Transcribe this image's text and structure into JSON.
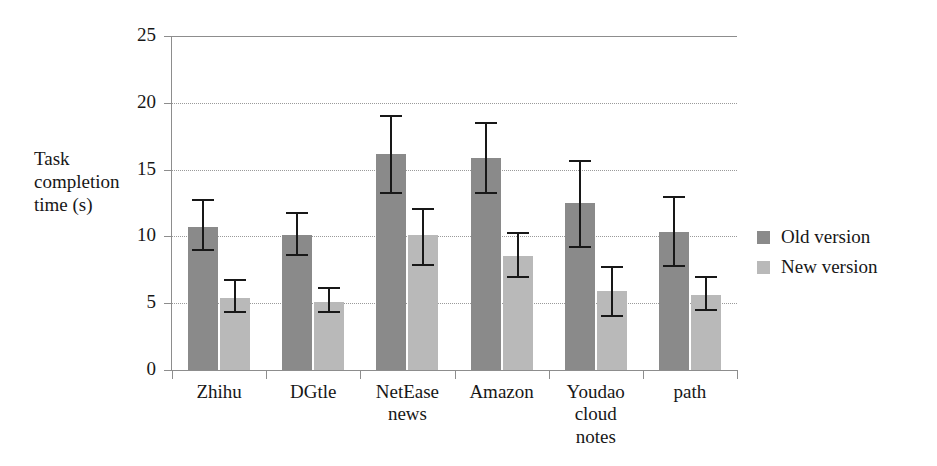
{
  "chart_data": {
    "type": "bar",
    "title": "",
    "xlabel": "",
    "ylabel": "Task completion time (s)",
    "ylim": [
      0,
      25
    ],
    "yticks": [
      0,
      5,
      10,
      15,
      20,
      25
    ],
    "grid": true,
    "legend_position": "right",
    "categories": [
      "Zhihu",
      "DGtle",
      "NetEase news",
      "Amazon",
      "Youdao cloud notes",
      "path"
    ],
    "series": [
      {
        "name": "Old version",
        "color": "#8a8a8a",
        "values": [
          10.7,
          10.1,
          16.2,
          15.9,
          12.5,
          10.3
        ],
        "error_low": [
          8.9,
          8.5,
          13.2,
          13.2,
          9.1,
          7.7
        ],
        "error_high": [
          12.8,
          11.8,
          19.1,
          18.6,
          15.7,
          13.0
        ]
      },
      {
        "name": "New version",
        "color": "#b9b9b9",
        "values": [
          5.4,
          5.1,
          10.1,
          8.5,
          5.9,
          5.6
        ],
        "error_low": [
          4.3,
          4.3,
          7.8,
          6.9,
          4.0,
          4.4
        ],
        "error_high": [
          6.8,
          6.2,
          12.1,
          10.3,
          7.8,
          7.0
        ]
      }
    ]
  },
  "axis": {
    "y_title_lines": [
      "Task",
      "completion",
      "time (s)"
    ],
    "y_tick_labels": [
      "25",
      "20",
      "15",
      "10",
      "5",
      "0"
    ]
  },
  "legend": {
    "items": [
      {
        "label": "Old version",
        "swatch": "series-old"
      },
      {
        "label": "New version",
        "swatch": "series-new"
      }
    ]
  }
}
